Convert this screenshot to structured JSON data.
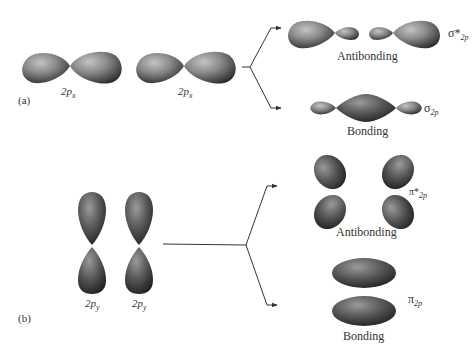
{
  "diagram": {
    "type": "molecular-orbital-formation",
    "panel_a": {
      "label": "(a)",
      "atomic_orbitals": [
        {
          "name": "2p",
          "subscript": "x"
        },
        {
          "name": "2p",
          "subscript": "x"
        }
      ],
      "antibonding": {
        "caption": "Antibonding",
        "symbol": "σ*",
        "subscript": "2p"
      },
      "bonding": {
        "caption": "Bonding",
        "symbol": "σ",
        "subscript": "2p"
      }
    },
    "panel_b": {
      "label": "(b)",
      "atomic_orbitals": [
        {
          "name": "2p",
          "subscript": "y"
        },
        {
          "name": "2p",
          "subscript": "y"
        }
      ],
      "antibonding": {
        "caption": "Antibonding",
        "symbol": "π*",
        "subscript": "2p"
      },
      "bonding": {
        "caption": "Bonding",
        "symbol": "π",
        "subscript": "2p"
      }
    },
    "colors": {
      "lobe_light": "#b8b8b8",
      "lobe_mid": "#7a7a7a",
      "lobe_dark": "#2a2a2a",
      "line": "#333333"
    }
  }
}
